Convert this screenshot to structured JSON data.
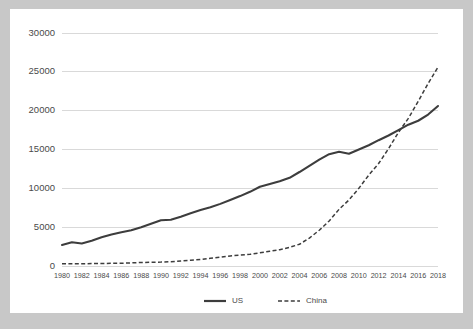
{
  "card": {
    "background_color": "#ffffff",
    "page_background_color": "#c8c8c8"
  },
  "chart_data": {
    "type": "line",
    "title": "",
    "subtitle": "",
    "xlabel": "",
    "ylabel": "",
    "grid": true,
    "legend_position": "bottom",
    "xlim": [
      1980,
      2018
    ],
    "ylim": [
      0,
      30000
    ],
    "yticks": [
      0,
      5000,
      10000,
      15000,
      20000,
      25000,
      30000
    ],
    "ytick_labels": [
      "0",
      "5000",
      "10000",
      "15000",
      "20000",
      "25000",
      "30000"
    ],
    "xticks": [
      1980,
      1982,
      1984,
      1986,
      1988,
      1990,
      1992,
      1994,
      1996,
      1998,
      2000,
      2002,
      2004,
      2006,
      2008,
      2010,
      2012,
      2014,
      2016,
      2018
    ],
    "xtick_labels": [
      "1980",
      "1982",
      "1984",
      "1986",
      "1988",
      "1990",
      "1992",
      "1994",
      "1996",
      "1998",
      "2000",
      "2002",
      "2004",
      "2006",
      "2008",
      "2010",
      "2012",
      "2014",
      "2016",
      "2018"
    ],
    "x": [
      1980,
      1981,
      1982,
      1983,
      1984,
      1985,
      1986,
      1987,
      1988,
      1989,
      1990,
      1991,
      1992,
      1993,
      1994,
      1995,
      1996,
      1997,
      1998,
      1999,
      2000,
      2001,
      2002,
      2003,
      2004,
      2005,
      2006,
      2007,
      2008,
      2009,
      2010,
      2011,
      2012,
      2013,
      2014,
      2015,
      2016,
      2017,
      2018
    ],
    "series": [
      {
        "name": "US",
        "style": "solid",
        "color": "#3d3d3d",
        "values": [
          2700,
          3050,
          2900,
          3250,
          3700,
          4050,
          4350,
          4600,
          5000,
          5450,
          5900,
          5950,
          6350,
          6800,
          7200,
          7550,
          8000,
          8500,
          9000,
          9550,
          10200,
          10550,
          10900,
          11350,
          12100,
          12900,
          13700,
          14400,
          14700,
          14450,
          15000,
          15550,
          16200,
          16800,
          17500,
          18200,
          18700,
          19500,
          20600
        ]
      },
      {
        "name": "China",
        "style": "dashed",
        "color": "#3d3d3d",
        "values": [
          300,
          290,
          280,
          310,
          320,
          340,
          360,
          400,
          450,
          480,
          500,
          550,
          650,
          750,
          850,
          1000,
          1150,
          1300,
          1400,
          1500,
          1700,
          1900,
          2100,
          2400,
          2800,
          3600,
          4600,
          5800,
          7300,
          8500,
          10000,
          11700,
          13200,
          15100,
          17200,
          19000,
          21200,
          23500,
          25600
        ]
      }
    ],
    "legend": [
      {
        "label": "US",
        "style": "solid"
      },
      {
        "label": "China",
        "style": "dashed"
      }
    ]
  }
}
